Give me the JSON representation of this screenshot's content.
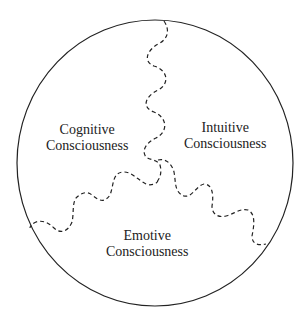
{
  "diagram": {
    "regions": [
      {
        "line1": "Cognitive",
        "line2": "Consciousness"
      },
      {
        "line1": "Intuitive",
        "line2": "Consciousness"
      },
      {
        "line1": "Emotive",
        "line2": "Consciousness"
      }
    ],
    "colors": {
      "stroke": "#222222",
      "background": "#ffffff"
    }
  }
}
